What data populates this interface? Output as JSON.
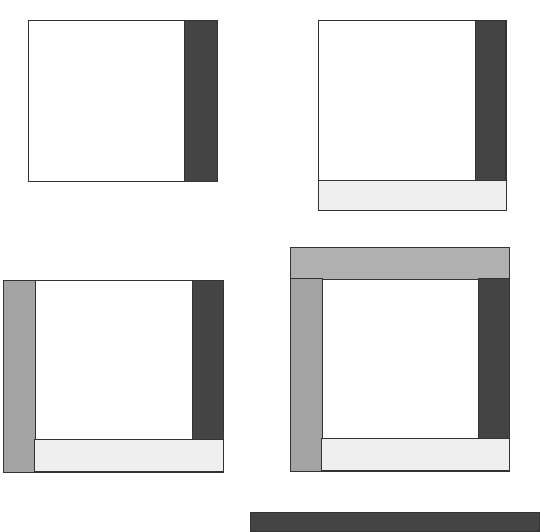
{
  "diagram": {
    "colors": {
      "center": "#ffffff",
      "right_strip": "#444444",
      "bottom_strip": "#efefef",
      "left_strip": "#a3a3a3",
      "top_strip": "#b0b0b0",
      "outline": "#333333"
    },
    "steps": [
      {
        "step": 1,
        "strips": [
          "right"
        ]
      },
      {
        "step": 2,
        "strips": [
          "right",
          "bottom"
        ]
      },
      {
        "step": 3,
        "strips": [
          "right",
          "bottom",
          "left"
        ]
      },
      {
        "step": 4,
        "strips": [
          "right",
          "bottom",
          "left",
          "top"
        ]
      },
      {
        "step": 5,
        "strips": [
          "next-strip-partial"
        ]
      }
    ]
  }
}
